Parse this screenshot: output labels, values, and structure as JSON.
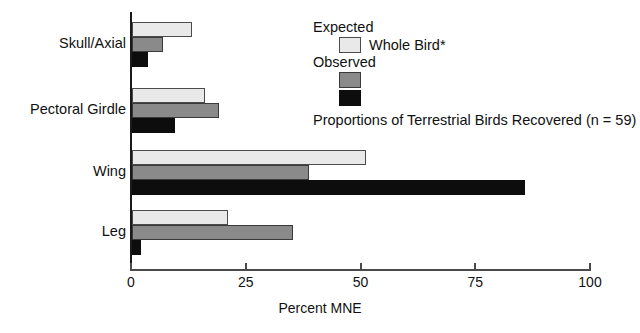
{
  "chart_data": {
    "type": "bar",
    "orientation": "horizontal",
    "title": "",
    "caption": "Proportions of Terrestrial Birds Recovered (n = 59)",
    "xlabel": "Percent MNE",
    "ylabel": "",
    "xlim": [
      0,
      100
    ],
    "xticks": [
      0,
      25,
      50,
      75,
      100
    ],
    "xtick_labels": [
      "0",
      "25",
      "50",
      "75",
      "100"
    ],
    "grid": false,
    "legend_position": "upper-right-inside",
    "categories": [
      "Skull/Axial",
      "Pectoral Girdle",
      "Wing",
      "Leg"
    ],
    "series": [
      {
        "name": "Whole Bird*",
        "group": "Expected",
        "color": "#e9e9e9",
        "values": [
          13.0,
          16.0,
          51.0,
          21.0
        ]
      },
      {
        "name": "Observed (gray)",
        "group": "Observed",
        "color": "#8a8a8a",
        "values": [
          6.7,
          19.0,
          38.5,
          35.0
        ]
      },
      {
        "name": "Observed (black)",
        "group": "Observed",
        "color": "#0d0d0d",
        "values": [
          3.5,
          9.3,
          85.7,
          2.0
        ]
      }
    ]
  },
  "legend": {
    "expected_heading": "Expected",
    "expected_item_label": "Whole Bird*",
    "observed_heading": "Observed",
    "caption": "Proportions of Terrestrial Birds Recovered (n = 59)"
  },
  "axis": {
    "x_title": "Percent MNE",
    "tick_0": "0",
    "tick_25": "25",
    "tick_50": "50",
    "tick_75": "75",
    "tick_100": "100"
  },
  "categories": {
    "c0": "Skull/Axial",
    "c1": "Pectoral Girdle",
    "c2": "Wing",
    "c3": "Leg"
  }
}
